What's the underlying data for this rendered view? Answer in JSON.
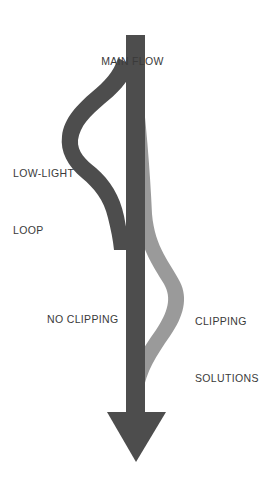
{
  "diagram": {
    "background_color": "#ffffff",
    "width": 265,
    "height": 481,
    "type": "flow-arrow-diagram",
    "colors": {
      "main_flow_dark": "#4d4d4d",
      "branch_light": "#9a9a9a",
      "label_text": "#3a3a3a"
    },
    "labels": {
      "main_flow": "MAIN FLOW",
      "low_light_loop_line1": "LOW-LIGHT",
      "low_light_loop_line2": "LOOP",
      "no_clipping": "NO CLIPPING",
      "clipping_solutions_line1": "CLIPPING",
      "clipping_solutions_line2": "SOLUTIONS"
    },
    "shapes": {
      "main_arrow": {
        "name": "main-flow-arrow",
        "color": "#4d4d4d",
        "shaft_left_x": 126,
        "shaft_right_x": 145,
        "shaft_top_y": 35,
        "arrowhead_top_y": 412,
        "arrowhead_left_x": 107,
        "arrowhead_right_x": 166,
        "tip_x": 136,
        "tip_y": 462
      },
      "low_light_loop_branch": {
        "name": "low-light-loop-branch",
        "color": "#4d4d4d",
        "branch_start_y": 75,
        "extreme_left_x": 78,
        "extreme_left_y": 140,
        "rejoin_y": 235
      },
      "clipping_solutions_branch": {
        "name": "clipping-solutions-branch",
        "color": "#9a9a9a",
        "branch_start_y": 75,
        "extreme_right_x": 188,
        "extreme_right_y": 295,
        "rejoin_y": 375
      }
    }
  }
}
